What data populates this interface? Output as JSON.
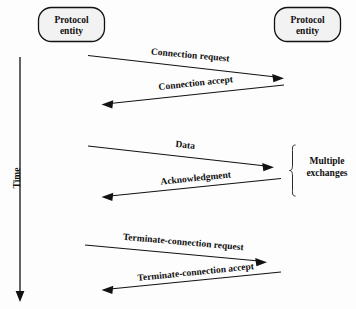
{
  "diagram": {
    "background_color": "#fdfdfd",
    "line_color": "#121212",
    "box_fill_color": "#f2f2f2",
    "entities": [
      {
        "id": "left",
        "line1": "Protocol",
        "line2": "entity"
      },
      {
        "id": "right",
        "line1": "Protocol",
        "line2": "entity"
      }
    ],
    "time_axis": {
      "label": "Time",
      "direction": "downward"
    },
    "messages": [
      {
        "label": "Connection request",
        "direction": "left-to-right"
      },
      {
        "label": "Connection accept",
        "direction": "right-to-left"
      },
      {
        "label": "Data",
        "direction": "left-to-right"
      },
      {
        "label": "Acknowledgment",
        "direction": "right-to-left"
      },
      {
        "label": "Terminate-connection request",
        "direction": "left-to-right"
      },
      {
        "label": "Terminate-connection accept",
        "direction": "right-to-left"
      }
    ],
    "annotation": {
      "line1": "Multiple",
      "line2": "exchanges"
    }
  }
}
